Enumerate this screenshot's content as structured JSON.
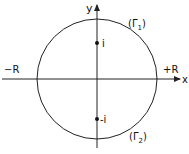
{
  "diagram": {
    "axes": {
      "x_label": "x",
      "y_label": "y"
    },
    "circle": {
      "center": [
        97,
        79
      ],
      "radius": 60
    },
    "points": [
      {
        "label": "i",
        "x": 97,
        "y": 43
      },
      {
        "label": "-i",
        "x": 97,
        "y": 119
      }
    ],
    "labels": {
      "neg_R": "−R",
      "pos_R": "+R",
      "gamma1": "(Γ",
      "gamma1_sub": "1",
      "gamma2": "(Γ",
      "gamma2_sub": "2",
      "close_paren": ")"
    },
    "colors": {
      "stroke": "#222222",
      "background": "#ffffff"
    }
  }
}
